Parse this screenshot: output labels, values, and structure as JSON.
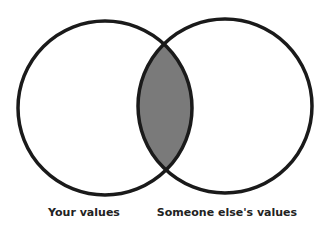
{
  "diagram": {
    "type": "venn",
    "sets": [
      {
        "label": "Your values",
        "cx": 105,
        "cy": 108,
        "r": 87
      },
      {
        "label": "Someone else's values",
        "cx": 225,
        "cy": 106,
        "r": 87
      }
    ],
    "intersection_fill": "#7a7a7a",
    "stroke_color": "#1a1a1a"
  },
  "labels": {
    "left": "Your values",
    "right": "Someone else's values"
  }
}
